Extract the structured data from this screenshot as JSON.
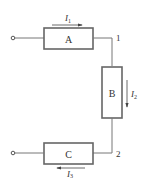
{
  "diagram": {
    "components": [
      {
        "id": "A",
        "label": "A"
      },
      {
        "id": "B",
        "label": "B"
      },
      {
        "id": "C",
        "label": "C"
      }
    ],
    "nodes": [
      {
        "id": "1",
        "label": "1"
      },
      {
        "id": "2",
        "label": "2"
      }
    ],
    "currents": [
      {
        "id": "I1",
        "symbol": "I",
        "subscript": "1",
        "direction": "right"
      },
      {
        "id": "I2",
        "symbol": "I",
        "subscript": "2",
        "direction": "down"
      },
      {
        "id": "I3",
        "symbol": "I",
        "subscript": "3",
        "direction": "left"
      }
    ],
    "colors": {
      "line": "#555555",
      "box": "#666666",
      "text": "#333333"
    }
  }
}
